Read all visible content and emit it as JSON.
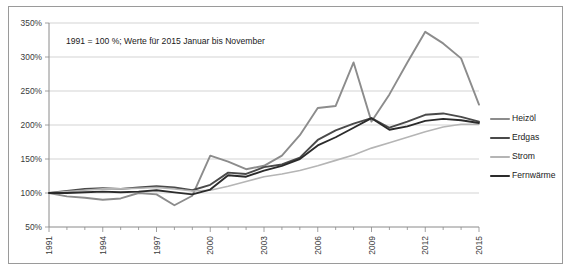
{
  "figure": {
    "frame_border_color": "#9a9a9a",
    "background": "#ffffff",
    "annotation": "1991 = 100 %; Werte für 2015  Januar bis  November"
  },
  "axes": {
    "y_ticks": [
      "50%",
      "100%",
      "150%",
      "200%",
      "250%",
      "300%",
      "350%"
    ],
    "x_ticks": [
      "1991",
      "1994",
      "1997",
      "2000",
      "2003",
      "2006",
      "2009",
      "2012",
      "2015"
    ]
  },
  "legend": {
    "position": "right",
    "entries": [
      {
        "label": "Heizöl",
        "color": "#8c8c8c"
      },
      {
        "label": "Erdgas",
        "color": "#4a4a4a"
      },
      {
        "label": "Strom",
        "color": "#b5b5b5"
      },
      {
        "label": "Fernwärme",
        "color": "#2b2b2b"
      }
    ]
  },
  "chart_data": {
    "type": "line",
    "title": "",
    "subtitle": "",
    "xlabel": "",
    "ylabel": "",
    "annotation": "1991 = 100 %; Werte für 2015  Januar bis  November",
    "grid": true,
    "legend_position": "right",
    "ylim": [
      50,
      350
    ],
    "ytick_values": [
      50,
      100,
      150,
      200,
      250,
      300,
      350
    ],
    "x": [
      1991,
      1992,
      1993,
      1994,
      1995,
      1996,
      1997,
      1998,
      1999,
      2000,
      2001,
      2002,
      2003,
      2004,
      2005,
      2006,
      2007,
      2008,
      2009,
      2010,
      2011,
      2012,
      2013,
      2014,
      2015
    ],
    "xtick_values": [
      1991,
      1994,
      1997,
      2000,
      2003,
      2006,
      2009,
      2012,
      2015
    ],
    "series": [
      {
        "name": "Heizöl",
        "color": "#8c8c8c",
        "width": 1.9,
        "values": [
          100,
          95,
          93,
          90,
          92,
          100,
          98,
          82,
          96,
          155,
          146,
          135,
          140,
          155,
          185,
          225,
          228,
          292,
          205,
          245,
          292,
          337,
          320,
          298,
          230
        ]
      },
      {
        "name": "Erdgas",
        "color": "#4a4a4a",
        "width": 1.9,
        "values": [
          100,
          103,
          106,
          107,
          106,
          108,
          110,
          108,
          104,
          112,
          130,
          128,
          138,
          142,
          152,
          178,
          192,
          202,
          210,
          196,
          205,
          215,
          217,
          212,
          205
        ]
      },
      {
        "name": "Strom",
        "color": "#b5b5b5",
        "width": 1.6,
        "values": [
          100,
          102,
          104,
          106,
          106,
          107,
          108,
          106,
          103,
          104,
          110,
          117,
          124,
          128,
          133,
          140,
          148,
          156,
          166,
          174,
          182,
          190,
          197,
          201,
          201
        ]
      },
      {
        "name": "Fernwärme",
        "color": "#2b2b2b",
        "width": 1.9,
        "values": [
          100,
          100,
          101,
          102,
          101,
          102,
          104,
          101,
          98,
          105,
          126,
          124,
          133,
          140,
          150,
          170,
          182,
          196,
          210,
          193,
          198,
          206,
          209,
          207,
          203
        ]
      }
    ]
  }
}
